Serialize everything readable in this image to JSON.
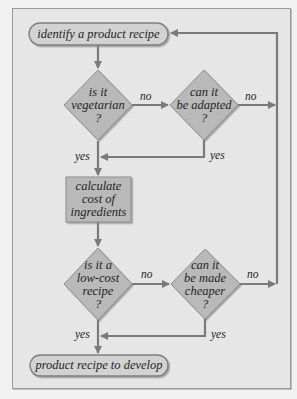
{
  "diagram": {
    "type": "flowchart",
    "colors": {
      "background": "#e6e6e6",
      "frame_border": "#9a9a9a",
      "shape_fill": "#b9b9b9",
      "shape_stroke": "#8c8c8c",
      "terminal_fill": "#d2d2d2",
      "arrow": "#7a7a7a",
      "text": "#1f1f1f"
    },
    "nodes": {
      "start": {
        "shape": "terminal",
        "text": "identify a product recipe"
      },
      "q_vegetarian": {
        "shape": "decision",
        "lines": [
          "is it",
          "vegetarian",
          "?"
        ]
      },
      "q_adapted": {
        "shape": "decision",
        "lines": [
          "can it",
          "be adapted",
          "?"
        ]
      },
      "calc_cost": {
        "shape": "process",
        "lines": [
          "calculate",
          "cost of",
          "ingredients"
        ]
      },
      "q_low_cost": {
        "shape": "decision",
        "lines": [
          "is it a",
          "low-cost",
          "recipe",
          "?"
        ]
      },
      "q_cheaper": {
        "shape": "decision",
        "lines": [
          "can it",
          "be made",
          "cheaper",
          "?"
        ]
      },
      "end": {
        "shape": "terminal",
        "text": "product recipe to develop"
      }
    },
    "edge_labels": {
      "vegetarian_no": "no",
      "adapted_no": "no",
      "vegetarian_yes": "yes",
      "adapted_yes": "yes",
      "low_cost_no": "no",
      "cheaper_no": "no",
      "low_cost_yes": "yes",
      "cheaper_yes": "yes"
    },
    "edges": [
      {
        "from": "start",
        "to": "q_vegetarian"
      },
      {
        "from": "q_vegetarian",
        "to": "q_adapted",
        "label": "no"
      },
      {
        "from": "q_adapted",
        "to": "start",
        "label": "no"
      },
      {
        "from": "q_vegetarian",
        "to": "calc_cost",
        "label": "yes"
      },
      {
        "from": "q_adapted",
        "to": "calc_cost",
        "label": "yes"
      },
      {
        "from": "calc_cost",
        "to": "q_low_cost"
      },
      {
        "from": "q_low_cost",
        "to": "q_cheaper",
        "label": "no"
      },
      {
        "from": "q_cheaper",
        "to": "start",
        "label": "no"
      },
      {
        "from": "q_low_cost",
        "to": "end",
        "label": "yes"
      },
      {
        "from": "q_cheaper",
        "to": "end",
        "label": "yes"
      }
    ]
  }
}
